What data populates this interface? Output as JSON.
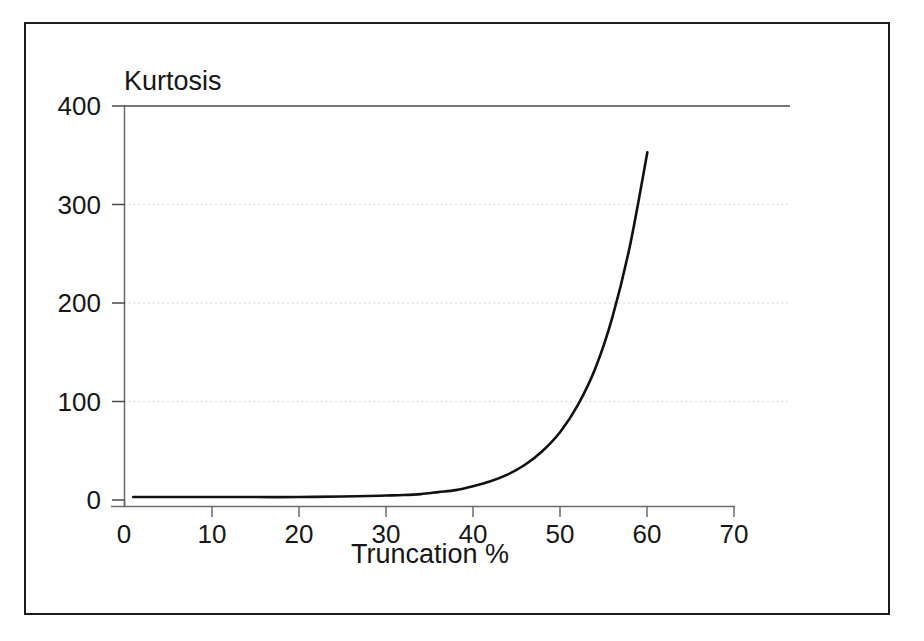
{
  "chart_data": {
    "type": "line",
    "title": "",
    "subtitle": "",
    "xlabel": "Truncation %",
    "ylabel": "Kurtosis",
    "xlim": [
      0,
      70
    ],
    "ylim": [
      0,
      400
    ],
    "xticks": [
      0,
      10,
      20,
      30,
      40,
      50,
      60,
      70
    ],
    "yticks": [
      0,
      100,
      200,
      300,
      400
    ],
    "grid": "horizontal-dotted-faint",
    "legend": "none",
    "annotations": [],
    "series": [
      {
        "name": "Kurtosis vs Truncation",
        "color": "#111111",
        "x": [
          1,
          5,
          10,
          15,
          20,
          25,
          28,
          30,
          32,
          34,
          36,
          38,
          40,
          42,
          44,
          46,
          48,
          50,
          52,
          54,
          56,
          58,
          60
        ],
        "values": [
          3,
          3,
          3,
          3,
          3,
          3.5,
          4,
          4.5,
          5,
          6,
          8,
          10,
          14,
          19,
          26,
          36,
          50,
          69,
          96,
          133,
          186,
          258,
          353
        ]
      }
    ]
  },
  "axes": {
    "y_tick_labels": [
      "400",
      "300",
      "200",
      "100",
      "0"
    ],
    "x_tick_labels": [
      "0",
      "10",
      "20",
      "30",
      "40",
      "50",
      "60",
      "70"
    ],
    "y_title": "Kurtosis",
    "x_title": "Truncation %"
  },
  "colors": {
    "curve": "#111111",
    "axis": "#4a4a4a",
    "frame": "#1b1b1b",
    "grid": "#d8d8d8",
    "text": "#161616",
    "background": "#ffffff"
  }
}
